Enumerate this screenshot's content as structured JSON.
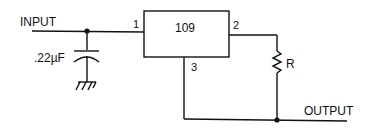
{
  "labels": {
    "input": "INPUT",
    "output": "OUTPUT",
    "capacitor": ".22µF",
    "ic": "109",
    "pin1": "1",
    "pin2": "2",
    "pin3": "3",
    "resistor": "R"
  },
  "colors": {
    "ink": "#111111",
    "background": "#ffffff"
  }
}
